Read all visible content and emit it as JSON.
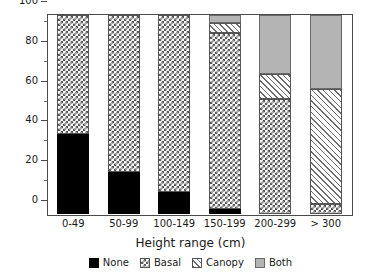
{
  "chart_data": {
    "type": "bar",
    "subtype": "stacked-bar-100-percent",
    "title": "",
    "xlabel": "Height range (cm)",
    "ylabel": "",
    "ylim": [
      0,
      100
    ],
    "xtick_labels": [
      "0-49",
      "50-99",
      "100-149",
      "150-199",
      "200-299",
      "> 300"
    ],
    "ytick_labels": [
      "0",
      "20",
      "40",
      "60",
      "80",
      "100"
    ],
    "ytick_values": [
      0,
      20,
      40,
      60,
      80,
      100
    ],
    "yminor_values": [
      10,
      30,
      50,
      70,
      90
    ],
    "grid": false,
    "legend_position": "below-axis",
    "categories": [
      "0-49",
      "50-99",
      "100-149",
      "150-199",
      "200-299",
      "> 300"
    ],
    "series": [
      {
        "name": "None",
        "pattern": "solid-black",
        "color": "#000000",
        "values": [
          40,
          21,
          11,
          2.5,
          0,
          0
        ]
      },
      {
        "name": "Basal",
        "pattern": "checkerboard",
        "color": "#555555",
        "values": [
          60,
          79,
          89,
          88.5,
          58,
          5
        ]
      },
      {
        "name": "Canopy",
        "pattern": "diagonal-hatch",
        "color": "#6d6d6d",
        "values": [
          0,
          0,
          0,
          5,
          12.5,
          58
        ]
      },
      {
        "name": "Both",
        "pattern": "solid-gray",
        "color": "#b4b4b4",
        "values": [
          0,
          0,
          0,
          4,
          29.5,
          37
        ]
      }
    ]
  },
  "axes": {
    "x_title": "Height range (cm)",
    "y_ticks": [
      {
        "value": 100,
        "label": "100"
      },
      {
        "value": 80,
        "label": "80"
      },
      {
        "value": 60,
        "label": "60"
      },
      {
        "value": 40,
        "label": "40"
      },
      {
        "value": 20,
        "label": "20"
      },
      {
        "value": 0,
        "label": "0"
      }
    ],
    "y_minor_ticks": [
      90,
      70,
      50,
      30,
      10
    ],
    "x_ticks": [
      {
        "label": "0-49"
      },
      {
        "label": "50-99"
      },
      {
        "label": "100-149"
      },
      {
        "label": "150-199"
      },
      {
        "label": "200-299"
      },
      {
        "label": "> 300"
      }
    ]
  },
  "legend": {
    "items": [
      {
        "label": "None",
        "swatch": "legend-swatch-none"
      },
      {
        "label": "Basal",
        "swatch": "legend-swatch-basal"
      },
      {
        "label": "Canopy",
        "swatch": "legend-swatch-canopy"
      },
      {
        "label": "Both",
        "swatch": "legend-swatch-both"
      }
    ]
  },
  "colors": {
    "none": "#000000",
    "basal": "#555555",
    "canopy": "#6d6d6d",
    "both": "#b4b4b4",
    "frame": "#4a4a4a",
    "background": "#ffffff"
  }
}
